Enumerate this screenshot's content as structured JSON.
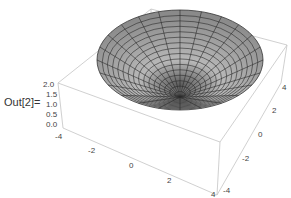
{
  "cell": {
    "out_label": "Out[2]="
  },
  "chart_data": {
    "type": "surface3d",
    "title": "",
    "x_ticks": [
      "-4",
      "-2",
      "0",
      "2",
      "4"
    ],
    "y_ticks": [
      "-4",
      "-2",
      "0",
      "2",
      "4"
    ],
    "z_ticks": [
      "0.0",
      "0.5",
      "1.0",
      "1.5",
      "2.0"
    ],
    "xlim": [
      -4,
      4
    ],
    "ylim": [
      -4,
      4
    ],
    "zlim": [
      0,
      2
    ],
    "mesh": {
      "radial_lines": 24,
      "rings": 16
    },
    "colors": {
      "surface": "#9a9a9a",
      "mesh": "#222222",
      "box": "#bdbdbd"
    }
  }
}
